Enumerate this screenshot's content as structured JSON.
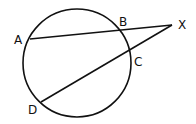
{
  "diagram": {
    "type": "secant-secant",
    "points": {
      "A": {
        "label": "A"
      },
      "B": {
        "label": "B"
      },
      "C": {
        "label": "C"
      },
      "D": {
        "label": "D"
      },
      "X": {
        "label": "X"
      }
    },
    "segments": [
      {
        "name": "secant-AX",
        "from": "A",
        "through": "B",
        "to": "X"
      },
      {
        "name": "secant-DX",
        "from": "D",
        "through": "C",
        "to": "X"
      }
    ],
    "circle": {
      "name": "circle",
      "points_on_circle": [
        "A",
        "B",
        "C",
        "D"
      ]
    },
    "stroke_color": "#111111",
    "background_color": "#ffffff"
  }
}
